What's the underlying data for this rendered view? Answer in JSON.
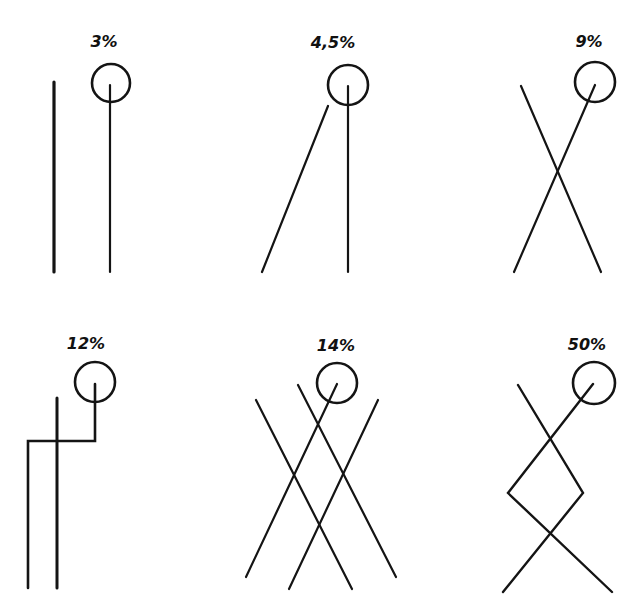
{
  "figure": {
    "type": "diagram",
    "stroke_color": "#141414",
    "background": "#ffffff",
    "panels": [
      {
        "id": "p1",
        "label": "3%",
        "label_pos": [
          104,
          47
        ],
        "circle": {
          "cx": 111,
          "cy": 83,
          "r": 19
        },
        "lines": [
          {
            "points": [
              [
                54,
                82
              ],
              [
                54,
                272
              ]
            ],
            "width": 3.2
          },
          {
            "points": [
              [
                110,
                85
              ],
              [
                110,
                272
              ]
            ],
            "width": 2.2
          }
        ]
      },
      {
        "id": "p2",
        "label": "4,5%",
        "label_pos": [
          333,
          48
        ],
        "circle": {
          "cx": 348,
          "cy": 85,
          "r": 20
        },
        "lines": [
          {
            "points": [
              [
                348,
                86
              ],
              [
                348,
                272
              ]
            ],
            "width": 2.2
          },
          {
            "points": [
              [
                328,
                106
              ],
              [
                262,
                272
              ]
            ],
            "width": 2.2
          }
        ]
      },
      {
        "id": "p3",
        "label": "9%",
        "label_pos": [
          589,
          47
        ],
        "circle": {
          "cx": 595,
          "cy": 82,
          "r": 20
        },
        "lines": [
          {
            "points": [
              [
                595,
                85
              ],
              [
                514,
                272
              ]
            ],
            "width": 2.2
          },
          {
            "points": [
              [
                521,
                86
              ],
              [
                601,
                272
              ]
            ],
            "width": 2.2
          }
        ]
      },
      {
        "id": "p4",
        "label": "12%",
        "label_pos": [
          86,
          349
        ],
        "circle": {
          "cx": 95,
          "cy": 382,
          "r": 20
        },
        "lines": [
          {
            "points": [
              [
                95,
                384
              ],
              [
                95,
                441
              ],
              [
                28,
                441
              ],
              [
                28,
                588
              ]
            ],
            "width": 2.6
          },
          {
            "points": [
              [
                57,
                398
              ],
              [
                57,
                588
              ]
            ],
            "width": 3.0
          }
        ]
      },
      {
        "id": "p5",
        "label": "14%",
        "label_pos": [
          336,
          351
        ],
        "circle": {
          "cx": 337,
          "cy": 383,
          "r": 20
        },
        "lines": [
          {
            "points": [
              [
                337,
                384
              ],
              [
                246,
                577
              ]
            ],
            "width": 2.2
          },
          {
            "points": [
              [
                298,
                385
              ],
              [
                396,
                577
              ]
            ],
            "width": 2.2
          },
          {
            "points": [
              [
                256,
                400
              ],
              [
                352,
                589
              ]
            ],
            "width": 2.2
          },
          {
            "points": [
              [
                378,
                400
              ],
              [
                289,
                589
              ]
            ],
            "width": 2.2
          }
        ]
      },
      {
        "id": "p6",
        "label": "50%",
        "label_pos": [
          587,
          350
        ],
        "circle": {
          "cx": 594,
          "cy": 383,
          "r": 21
        },
        "lines": [
          {
            "points": [
              [
                593,
                384
              ],
              [
                508,
                493
              ],
              [
                612,
                592
              ]
            ],
            "width": 2.4
          },
          {
            "points": [
              [
                518,
                385
              ],
              [
                583,
                493
              ],
              [
                503,
                592
              ]
            ],
            "width": 2.4
          }
        ]
      }
    ]
  },
  "labels": {
    "p1": "3%",
    "p2": "4,5%",
    "p3": "9%",
    "p4": "12%",
    "p5": "14%",
    "p6": "50%"
  }
}
